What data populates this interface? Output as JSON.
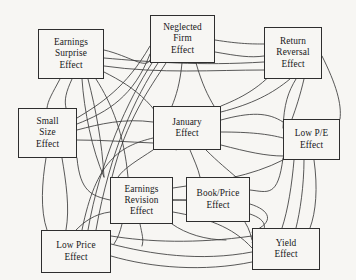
{
  "diagram": {
    "background_color": "#f7f6f3",
    "line_color": "#3b3b3b",
    "box_border_color": "#2e2e2e",
    "text_color": "#17161a",
    "nodes": [
      {
        "id": "earnings-surprise",
        "label": "Earnings Surprise Effect",
        "lines": [
          "Earnings",
          "Surprise",
          "Effect"
        ],
        "x": 38,
        "y": 29,
        "w": 66,
        "h": 50
      },
      {
        "id": "neglected-firm",
        "label": "Neglected Firm Effect",
        "lines": [
          "Neglected",
          "Firm",
          "Effect"
        ],
        "x": 150,
        "y": 15,
        "w": 65,
        "h": 48
      },
      {
        "id": "return-reversal",
        "label": "Return Reversal Effect",
        "lines": [
          "Return",
          "Reversal",
          "Effect"
        ],
        "x": 264,
        "y": 27,
        "w": 58,
        "h": 52
      },
      {
        "id": "small-size",
        "label": "Small Size Effect",
        "lines": [
          "Small",
          "Size",
          "Effect"
        ],
        "x": 18,
        "y": 108,
        "w": 59,
        "h": 50
      },
      {
        "id": "january",
        "label": "January Effect",
        "lines": [
          "January",
          "Effect"
        ],
        "x": 153,
        "y": 106,
        "w": 68,
        "h": 44
      },
      {
        "id": "low-pe",
        "label": "Low P/E Effect",
        "lines": [
          "Low P/E",
          "Effect"
        ],
        "x": 283,
        "y": 119,
        "w": 57,
        "h": 41
      },
      {
        "id": "earnings-revision",
        "label": "Earnings Revision Effect",
        "lines": [
          "Earnings",
          "Revision",
          "Effect"
        ],
        "x": 110,
        "y": 177,
        "w": 63,
        "h": 47
      },
      {
        "id": "book-price",
        "label": "Book/Price Effect",
        "lines": [
          "Book/Price",
          "Effect"
        ],
        "x": 186,
        "y": 177,
        "w": 64,
        "h": 45
      },
      {
        "id": "low-price",
        "label": "Low Price Effect",
        "lines": [
          "Low Price",
          "Effect"
        ],
        "x": 41,
        "y": 230,
        "w": 70,
        "h": 43
      },
      {
        "id": "yield",
        "label": "Yield Effect",
        "lines": [
          "Yield",
          "Effect"
        ],
        "x": 252,
        "y": 228,
        "w": 68,
        "h": 42
      }
    ],
    "edges": [
      "M 72,79 C 66,92 64,100 66,108",
      "M 60,79 C 52,94 48,100 47,108",
      "M 46,158 C 42,182 40,210 47,230",
      "M 62,158 C 66,182 70,208 66,230",
      "M 77,130 C 100,124 124,118 153,122",
      "M 77,140 C 104,140 128,142 153,143",
      "M 104,50 C 130,56 146,70 150,60",
      "M 104,58 C 150,62 200,66 264,62",
      "M 104,66 C 160,74 215,70 264,70",
      "M 215,40 C 240,44 252,44 264,44",
      "M 215,52 C 238,56 250,58 264,56",
      "M 182,63 C 180,84 176,96 172,106",
      "M 196,63 C 202,84 208,96 214,106",
      "M 166,63 C 150,88 126,120 112,177",
      "M 158,63 C 136,96 110,150 96,230",
      "M 152,63 C 128,100 100,160 88,230",
      "M 221,120 C 250,112 268,112 283,122",
      "M 221,132 C 250,132 268,134 283,138",
      "M 221,145 C 248,152 266,156 283,156",
      "M 173,188 C 214,182 252,176 283,160",
      "M 173,200 C 212,200 244,202 252,240",
      "M 173,212 C 206,218 232,226 252,248",
      "M 250,190 C 268,192 278,198 283,158",
      "M 250,204 C 270,210 276,222 252,232",
      "M 250,214 C 268,220 270,230 252,242",
      "M 111,244 C 150,254 200,262 252,252",
      "M 111,256 C 152,268 204,272 252,262",
      "M 111,236 C 148,242 196,244 252,236",
      "M 294,160 C 292,184 288,210 282,228",
      "M 304,160 C 304,186 300,212 296,228",
      "M 314,160 C 318,188 316,212 310,228",
      "M 322,56 C 336,84 342,104 340,119",
      "M 304,79 C 300,96 296,108 292,119",
      "M 296,79 C 288,92 284,104 283,128",
      "M 77,118 C 100,104 126,88 150,46",
      "M 77,124 C 108,112 134,96 150,54",
      "M 104,72 C 136,88 160,106 176,150",
      "M 96,79 C 112,104 124,134 128,177",
      "M 88,79 C 96,110 102,142 104,177",
      "M 104,177 C 92,150 84,110 82,79",
      "M 110,200 C 92,196 80,192 77,158",
      "M 110,212 C 94,214 84,222 76,230",
      "M 153,150 C 138,160 124,168 118,177",
      "M 190,150 C 194,160 198,168 200,177",
      "M 206,150 C 218,162 228,170 236,177",
      "M 153,138 C 120,146 96,160 82,230",
      "M 221,106 C 246,96 266,84 283,60",
      "M 221,112 C 252,104 272,94 290,79",
      "M 172,224 C 186,234 206,240 226,240",
      "M 186,200 C 172,200 160,200 173,200",
      "M 140,224 C 142,234 144,240 142,246",
      "M 122,224 C 120,232 118,238 114,244"
    ]
  }
}
